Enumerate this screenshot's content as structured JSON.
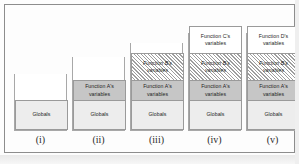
{
  "figure": {
    "columns": [
      {
        "caption": "(i)",
        "left": 14,
        "cup_top": 74,
        "cup_height": 57,
        "blocks": [
          {
            "kind": "globals",
            "label": "Globals"
          }
        ]
      },
      {
        "caption": "(ii)",
        "left": 72,
        "cup_top": 57,
        "cup_height": 74,
        "blocks": [
          {
            "kind": "a",
            "label": "Function A's variables"
          },
          {
            "kind": "globals",
            "label": "Globals"
          }
        ]
      },
      {
        "caption": "(iii)",
        "left": 130,
        "cup_top": 43,
        "cup_height": 88,
        "blocks": [
          {
            "kind": "b",
            "label": "Function B's variables"
          },
          {
            "kind": "a",
            "label": "Function A's variables"
          },
          {
            "kind": "globals",
            "label": "Globals"
          }
        ]
      },
      {
        "caption": "(iv)",
        "left": 188,
        "cup_top": 33,
        "cup_height": 98,
        "blocks": [
          {
            "kind": "c",
            "label": "Function C's variables"
          },
          {
            "kind": "b",
            "label": "Function B's variables"
          },
          {
            "kind": "a",
            "label": "Function A's variables"
          },
          {
            "kind": "globals",
            "label": "Globals"
          }
        ]
      },
      {
        "caption": "(v)",
        "left": 246,
        "cup_top": 33,
        "cup_height": 98,
        "blocks": [
          {
            "kind": "d",
            "label": "Function D's variables"
          },
          {
            "kind": "b",
            "label": "Function B's variables"
          },
          {
            "kind": "a",
            "label": "Function A's variables"
          },
          {
            "kind": "globals",
            "label": "Globals"
          }
        ]
      }
    ],
    "caption_top": 134,
    "colors": {
      "frame_border": "#8d8d8d",
      "cup_border": "#a8a8a8",
      "block_border": "#9a9a9a",
      "globals_fill": "#ededed",
      "function_a_fill": "#c6c6c6",
      "function_b_hatch": "#9e9e9e",
      "function_c_fill": "#ffffff",
      "function_d_fill": "#ffffff",
      "page_background": "#fdfdfd",
      "text": "#1d1d1d"
    }
  }
}
